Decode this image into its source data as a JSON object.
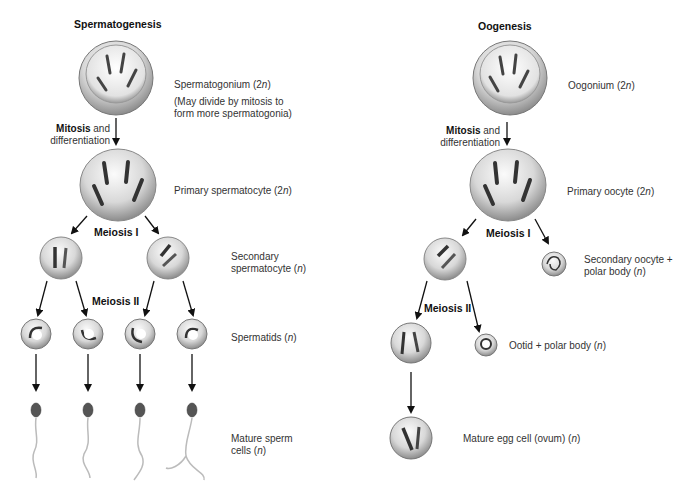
{
  "spermatogenesis": {
    "title": "Spermatogenesis",
    "mitosis_bold": "Mitosis",
    "mitosis_rest": " and",
    "differentiation": "differentiation",
    "meiosis1": "Meiosis I",
    "meiosis2": "Meiosis II",
    "stages": {
      "spermatogonium": {
        "name": "Spermatogonium (2",
        "n": "n",
        "close": ")"
      },
      "note_line1": "(May divide by mitosis to",
      "note_line2": "form more spermatogonia)",
      "primary": {
        "name": "Primary spermatocyte (2",
        "n": "n",
        "close": ")"
      },
      "secondary_line1": "Secondary",
      "secondary_line2": {
        "name": "spermatocyte (",
        "n": "n",
        "close": ")"
      },
      "spermatids": {
        "name": "Spermatids (",
        "n": "n",
        "close": ")"
      },
      "mature_line1": "Mature sperm",
      "mature_line2": {
        "name": "cells (",
        "n": "n",
        "close": ")"
      }
    }
  },
  "oogenesis": {
    "title": "Oogenesis",
    "mitosis_bold": "Mitosis",
    "mitosis_rest": " and",
    "differentiation": "differentiation",
    "meiosis1": "Meiosis I",
    "meiosis2": "Meiosis II",
    "stages": {
      "oogonium": {
        "name": "Oogonium (2",
        "n": "n",
        "close": ")"
      },
      "primary": {
        "name": "Primary oocyte (2",
        "n": "n",
        "close": ")"
      },
      "secondary_line1": "Secondary oocyte +",
      "secondary_line2": {
        "name": "polar body (",
        "n": "n",
        "close": ")"
      },
      "ootid": {
        "name": "Ootid + polar body (",
        "n": "n",
        "close": ")"
      },
      "mature": {
        "name": "Mature egg cell (ovum) (",
        "n": "n",
        "close": ")"
      }
    }
  },
  "colors": {
    "cell_fill": "#d9d9d9",
    "cell_edge": "#8a8a8a",
    "chromosome": "#3a3a3a",
    "arrow": "#111111"
  }
}
